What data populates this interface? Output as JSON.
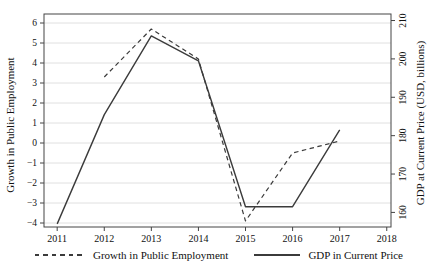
{
  "chart_data": {
    "type": "line",
    "title": "",
    "x_axis": {
      "label": "",
      "ticks": [
        2011,
        2012,
        2013,
        2014,
        2015,
        2016,
        2017,
        2018
      ],
      "range": [
        2010.72,
        2018.09
      ]
    },
    "left_axis": {
      "label": "Growth in Public Employment",
      "ticks": [
        -4,
        -3,
        -2,
        -1,
        0,
        1,
        2,
        3,
        4,
        5,
        6
      ],
      "range": [
        -4.2,
        6.45
      ]
    },
    "right_axis": {
      "label": "GDP at Current Price (USD, billions)",
      "ticks": [
        160,
        170,
        180,
        190,
        200,
        210
      ],
      "range": [
        156.2,
        211.7
      ]
    },
    "grid": {
      "horizontal": "left_axis_ticks",
      "color": "#d6d6d6",
      "vertical": false
    },
    "line_color": "#3b3b3b",
    "series": [
      {
        "name": "Growth in Public Employment",
        "axis": "left",
        "line_style": "dashed",
        "x": [
          2012,
          2013,
          2014,
          2015,
          2016,
          2017
        ],
        "values": [
          3.3,
          5.7,
          4.2,
          -3.9,
          -0.5,
          0.1
        ]
      },
      {
        "name": "GDP in Current Price",
        "axis": "right",
        "line_style": "solid",
        "x": [
          2011,
          2012,
          2013,
          2014,
          2015,
          2016,
          2017
        ],
        "values": [
          157,
          185.5,
          206,
          199.5,
          161.5,
          161.5,
          181.5
        ]
      }
    ],
    "legend_position": "bottom"
  }
}
